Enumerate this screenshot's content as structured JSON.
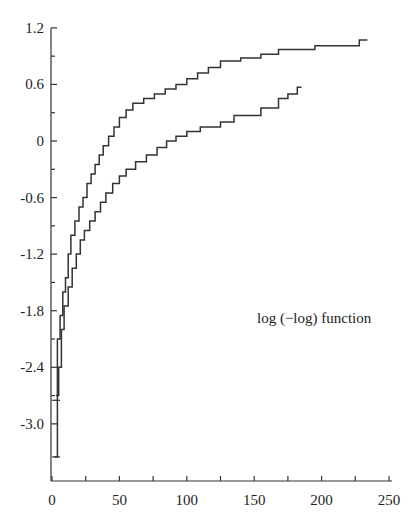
{
  "chart_data": {
    "type": "line",
    "step": true,
    "title": "",
    "annotation": "log (−log) function",
    "xlabel": "",
    "ylabel": "",
    "xlim": [
      0,
      250
    ],
    "ylim": [
      -3.6,
      1.2
    ],
    "x_ticks": [
      0,
      50,
      100,
      150,
      200,
      250
    ],
    "x_minor_ticks": [
      25,
      75,
      125,
      175,
      225
    ],
    "y_ticks": [
      1.2,
      0.6,
      0,
      -0.6,
      -1.2,
      -1.8,
      -2.4,
      -3.0
    ],
    "y_tick_labels": [
      "1.2",
      "0.6",
      "0",
      "-0.6",
      "-1.2",
      "-1.8",
      "-2.4",
      "-3.0"
    ],
    "grid": false,
    "legend": null,
    "series": [
      {
        "name": "upper",
        "x": [
          2,
          4,
          6,
          8,
          10,
          12,
          14,
          17,
          20,
          23,
          26,
          29,
          32,
          35,
          38,
          42,
          46,
          50,
          55,
          60,
          68,
          76,
          84,
          92,
          100,
          108,
          116,
          125,
          140,
          155,
          168,
          195,
          228,
          234
        ],
        "y": [
          -3.35,
          -2.1,
          -1.85,
          -1.6,
          -1.45,
          -1.2,
          -1.0,
          -0.85,
          -0.7,
          -0.6,
          -0.45,
          -0.35,
          -0.25,
          -0.15,
          -0.05,
          0.05,
          0.15,
          0.25,
          0.33,
          0.4,
          0.45,
          0.5,
          0.55,
          0.6,
          0.66,
          0.72,
          0.78,
          0.85,
          0.88,
          0.92,
          0.97,
          1.01,
          1.07,
          1.07
        ]
      },
      {
        "name": "lower",
        "x": [
          3,
          5,
          7,
          9,
          12,
          15,
          18,
          21,
          24,
          28,
          32,
          36,
          40,
          45,
          50,
          55,
          62,
          70,
          78,
          85,
          92,
          100,
          110,
          125,
          135,
          155,
          168,
          175,
          182,
          185
        ],
        "y": [
          -2.7,
          -2.4,
          -2.0,
          -1.75,
          -1.55,
          -1.35,
          -1.2,
          -1.05,
          -0.95,
          -0.85,
          -0.75,
          -0.65,
          -0.55,
          -0.45,
          -0.37,
          -0.3,
          -0.22,
          -0.15,
          -0.07,
          0.0,
          0.05,
          0.1,
          0.15,
          0.2,
          0.27,
          0.35,
          0.45,
          0.5,
          0.57,
          0.57
        ]
      }
    ],
    "error_marks": {
      "x": 3,
      "y": [
        -2.75,
        -3.35
      ]
    }
  }
}
